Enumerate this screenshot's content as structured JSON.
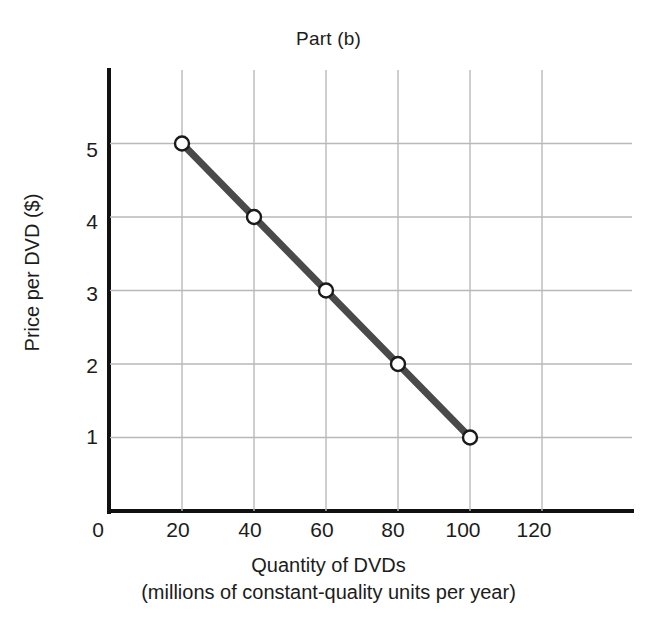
{
  "chart_data": {
    "type": "line",
    "title": "Part (b)",
    "xlabel": "Quantity of DVDs",
    "xlabel_sub": "(millions of constant-quality units per year)",
    "ylabel": "Price per DVD ($)",
    "x": [
      20,
      40,
      60,
      80,
      100
    ],
    "values": [
      5,
      4,
      3,
      2,
      1
    ],
    "series": [
      {
        "name": "Demand",
        "x": [
          20,
          40,
          60,
          80,
          100
        ],
        "values": [
          5,
          4,
          3,
          2,
          1
        ]
      }
    ],
    "points": [
      {
        "x": 20,
        "y": 5
      },
      {
        "x": 40,
        "y": 4
      },
      {
        "x": 60,
        "y": 3
      },
      {
        "x": 80,
        "y": 2
      },
      {
        "x": 100,
        "y": 1
      }
    ],
    "xlim": [
      0,
      145
    ],
    "ylim": [
      0,
      6
    ],
    "xticks": [
      0,
      20,
      40,
      60,
      80,
      100,
      120
    ],
    "yticks": [
      1,
      2,
      3,
      4,
      5
    ],
    "xtick_labels": [
      "0",
      "20",
      "40",
      "60",
      "80",
      "100",
      "120"
    ],
    "ytick_labels": [
      "1",
      "2",
      "3",
      "4",
      "5"
    ],
    "grid": true,
    "legend": null,
    "legend_position": "none",
    "colors": {
      "line": "#4a4a4a",
      "marker_fill": "#ffffff",
      "marker_edge": "#1a1a1a",
      "grid": "#b9b9b9",
      "axis": "#111111",
      "background": "#ffffff",
      "text": "#1c1c1c"
    },
    "line_width_px": 7,
    "marker_radius_px": 7
  },
  "axis": {
    "origin_label": "0"
  }
}
